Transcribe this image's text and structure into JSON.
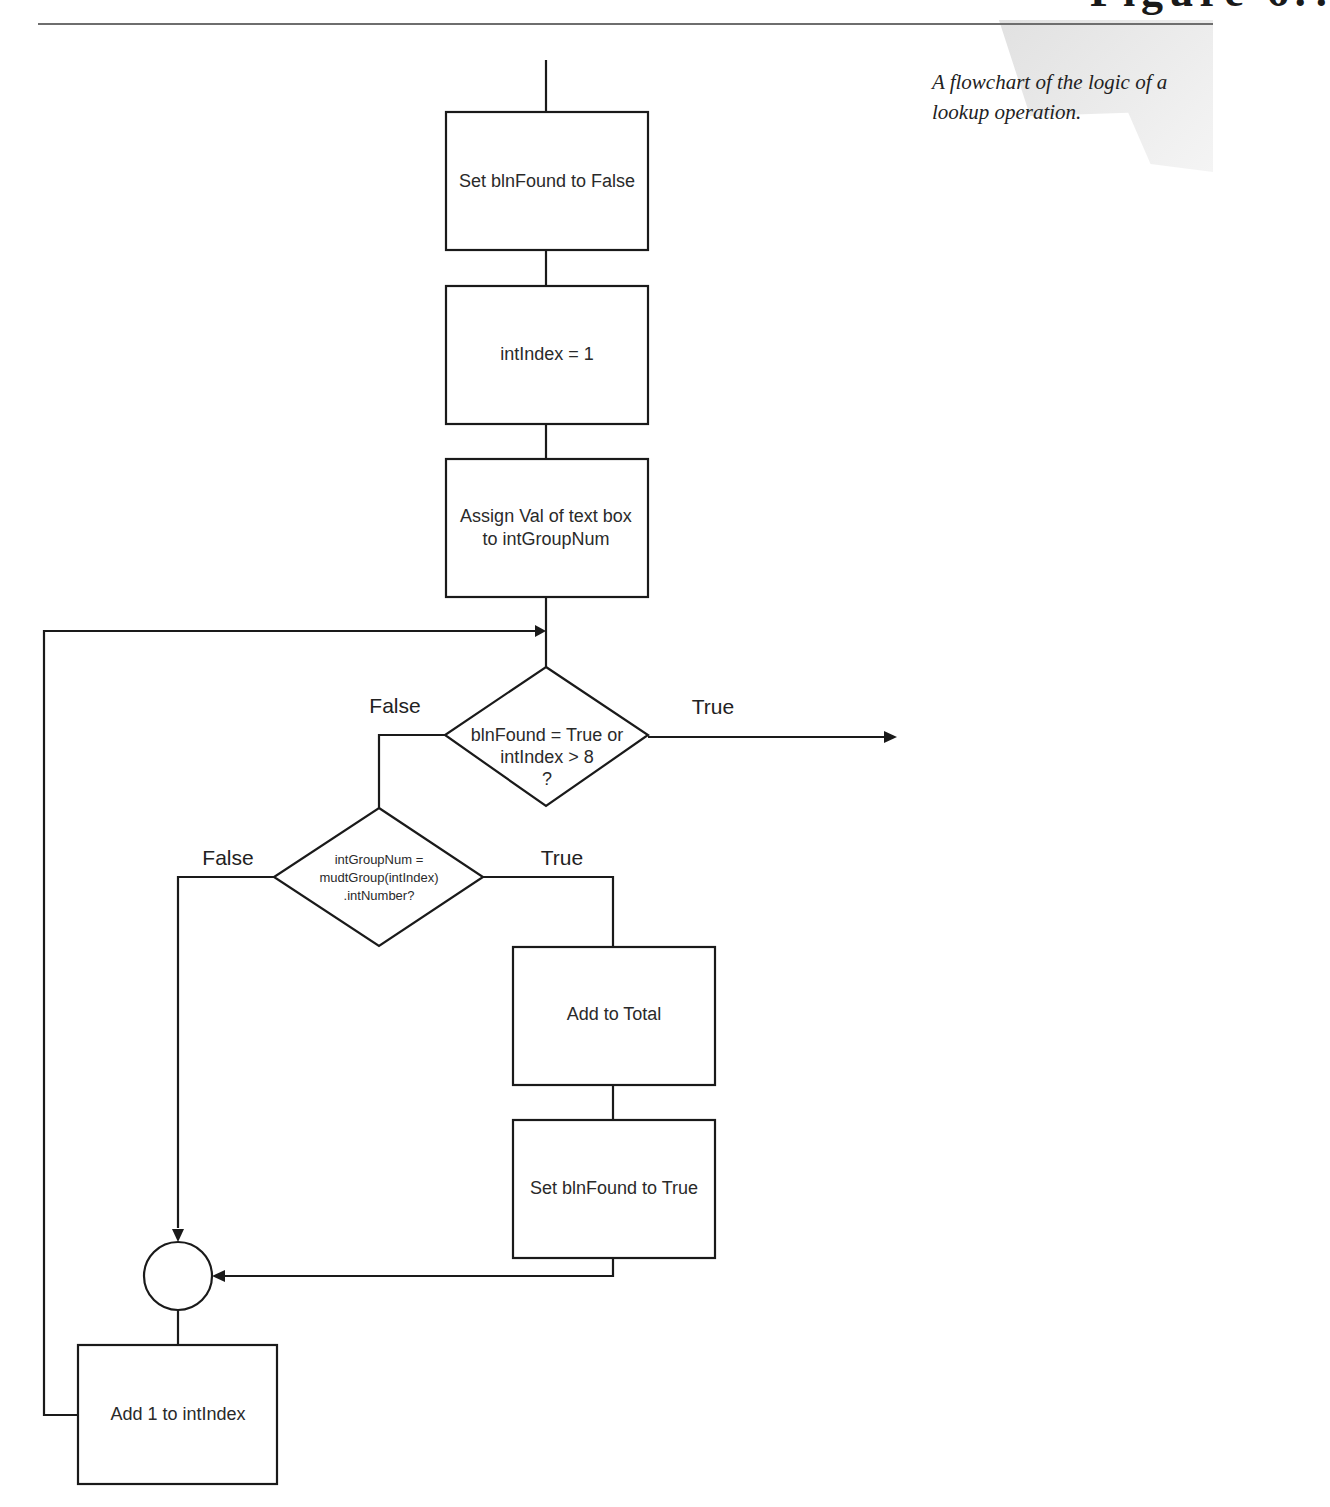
{
  "figure": {
    "heading_partial": "Figure 6.?",
    "caption": "A flowchart of the logic of a lookup operation."
  },
  "nodes": {
    "set_false": {
      "type": "process",
      "label": "Set blnFound to False"
    },
    "init_index": {
      "type": "process",
      "label": "intIndex = 1"
    },
    "assign_val": {
      "type": "process",
      "label_lines": [
        "Assign Val of text box",
        "to intGroupNum"
      ]
    },
    "loop_check": {
      "type": "decision",
      "label_lines": [
        "blnFound = True or",
        "intIndex > 8",
        "?"
      ]
    },
    "match_check": {
      "type": "decision",
      "label_lines": [
        "intGroupNum =",
        "mudtGroup(intIndex)",
        ".intNumber?"
      ]
    },
    "add_total": {
      "type": "process",
      "label": "Add to Total"
    },
    "set_true": {
      "type": "process",
      "label": "Set blnFound to True"
    },
    "junction": {
      "type": "connector",
      "label": ""
    },
    "increment": {
      "type": "process",
      "label": "Add 1 to intIndex"
    }
  },
  "edges": {
    "loop_false": "False",
    "loop_true": "True",
    "match_false": "False",
    "match_true": "True"
  }
}
